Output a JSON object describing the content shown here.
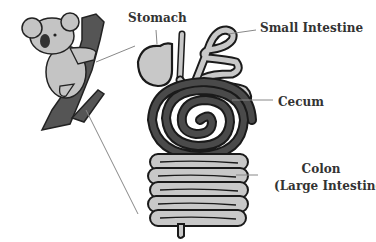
{
  "diagram": {
    "labels": {
      "stomach": "Stomach",
      "small_intestine": "Small Intestine",
      "cecum": "Cecum",
      "colon_line1": "Colon",
      "colon_line2": "(Large Intestine)"
    },
    "colors": {
      "outline": "#1a1a1a",
      "light_organ": "#c8c8c8",
      "dark_cecum": "#4a4a4a",
      "koala_fur": "#bdbdbd",
      "tree_bark": "#555555",
      "leader_line": "#888888"
    }
  }
}
